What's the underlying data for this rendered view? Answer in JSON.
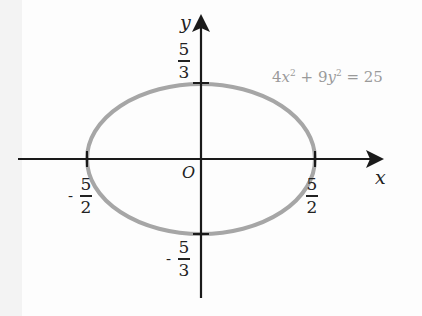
{
  "diagram": {
    "type": "ellipse-on-axes",
    "equation": {
      "lhs_term1_coef": "4",
      "lhs_term1_var": "x",
      "lhs_term1_exp": "2",
      "plus": "+",
      "lhs_term2_coef": "9",
      "lhs_term2_var": "y",
      "lhs_term2_exp": "2",
      "equals": "=",
      "rhs": "25"
    },
    "axes": {
      "x_label": "x",
      "y_label": "y",
      "origin_label": "O"
    },
    "intercepts": {
      "y_top": {
        "sign": "",
        "num": "5",
        "den": "3"
      },
      "y_bottom": {
        "sign": "-",
        "num": "5",
        "den": "3"
      },
      "x_left": {
        "sign": "-",
        "num": "5",
        "den": "2"
      },
      "x_right": {
        "sign": "",
        "num": "5",
        "den": "2"
      }
    },
    "colors": {
      "axis": "#1a1a1a",
      "ellipse": "#a6a6a6",
      "equation_text": "#9a9a9a",
      "label_text": "#222222"
    }
  }
}
